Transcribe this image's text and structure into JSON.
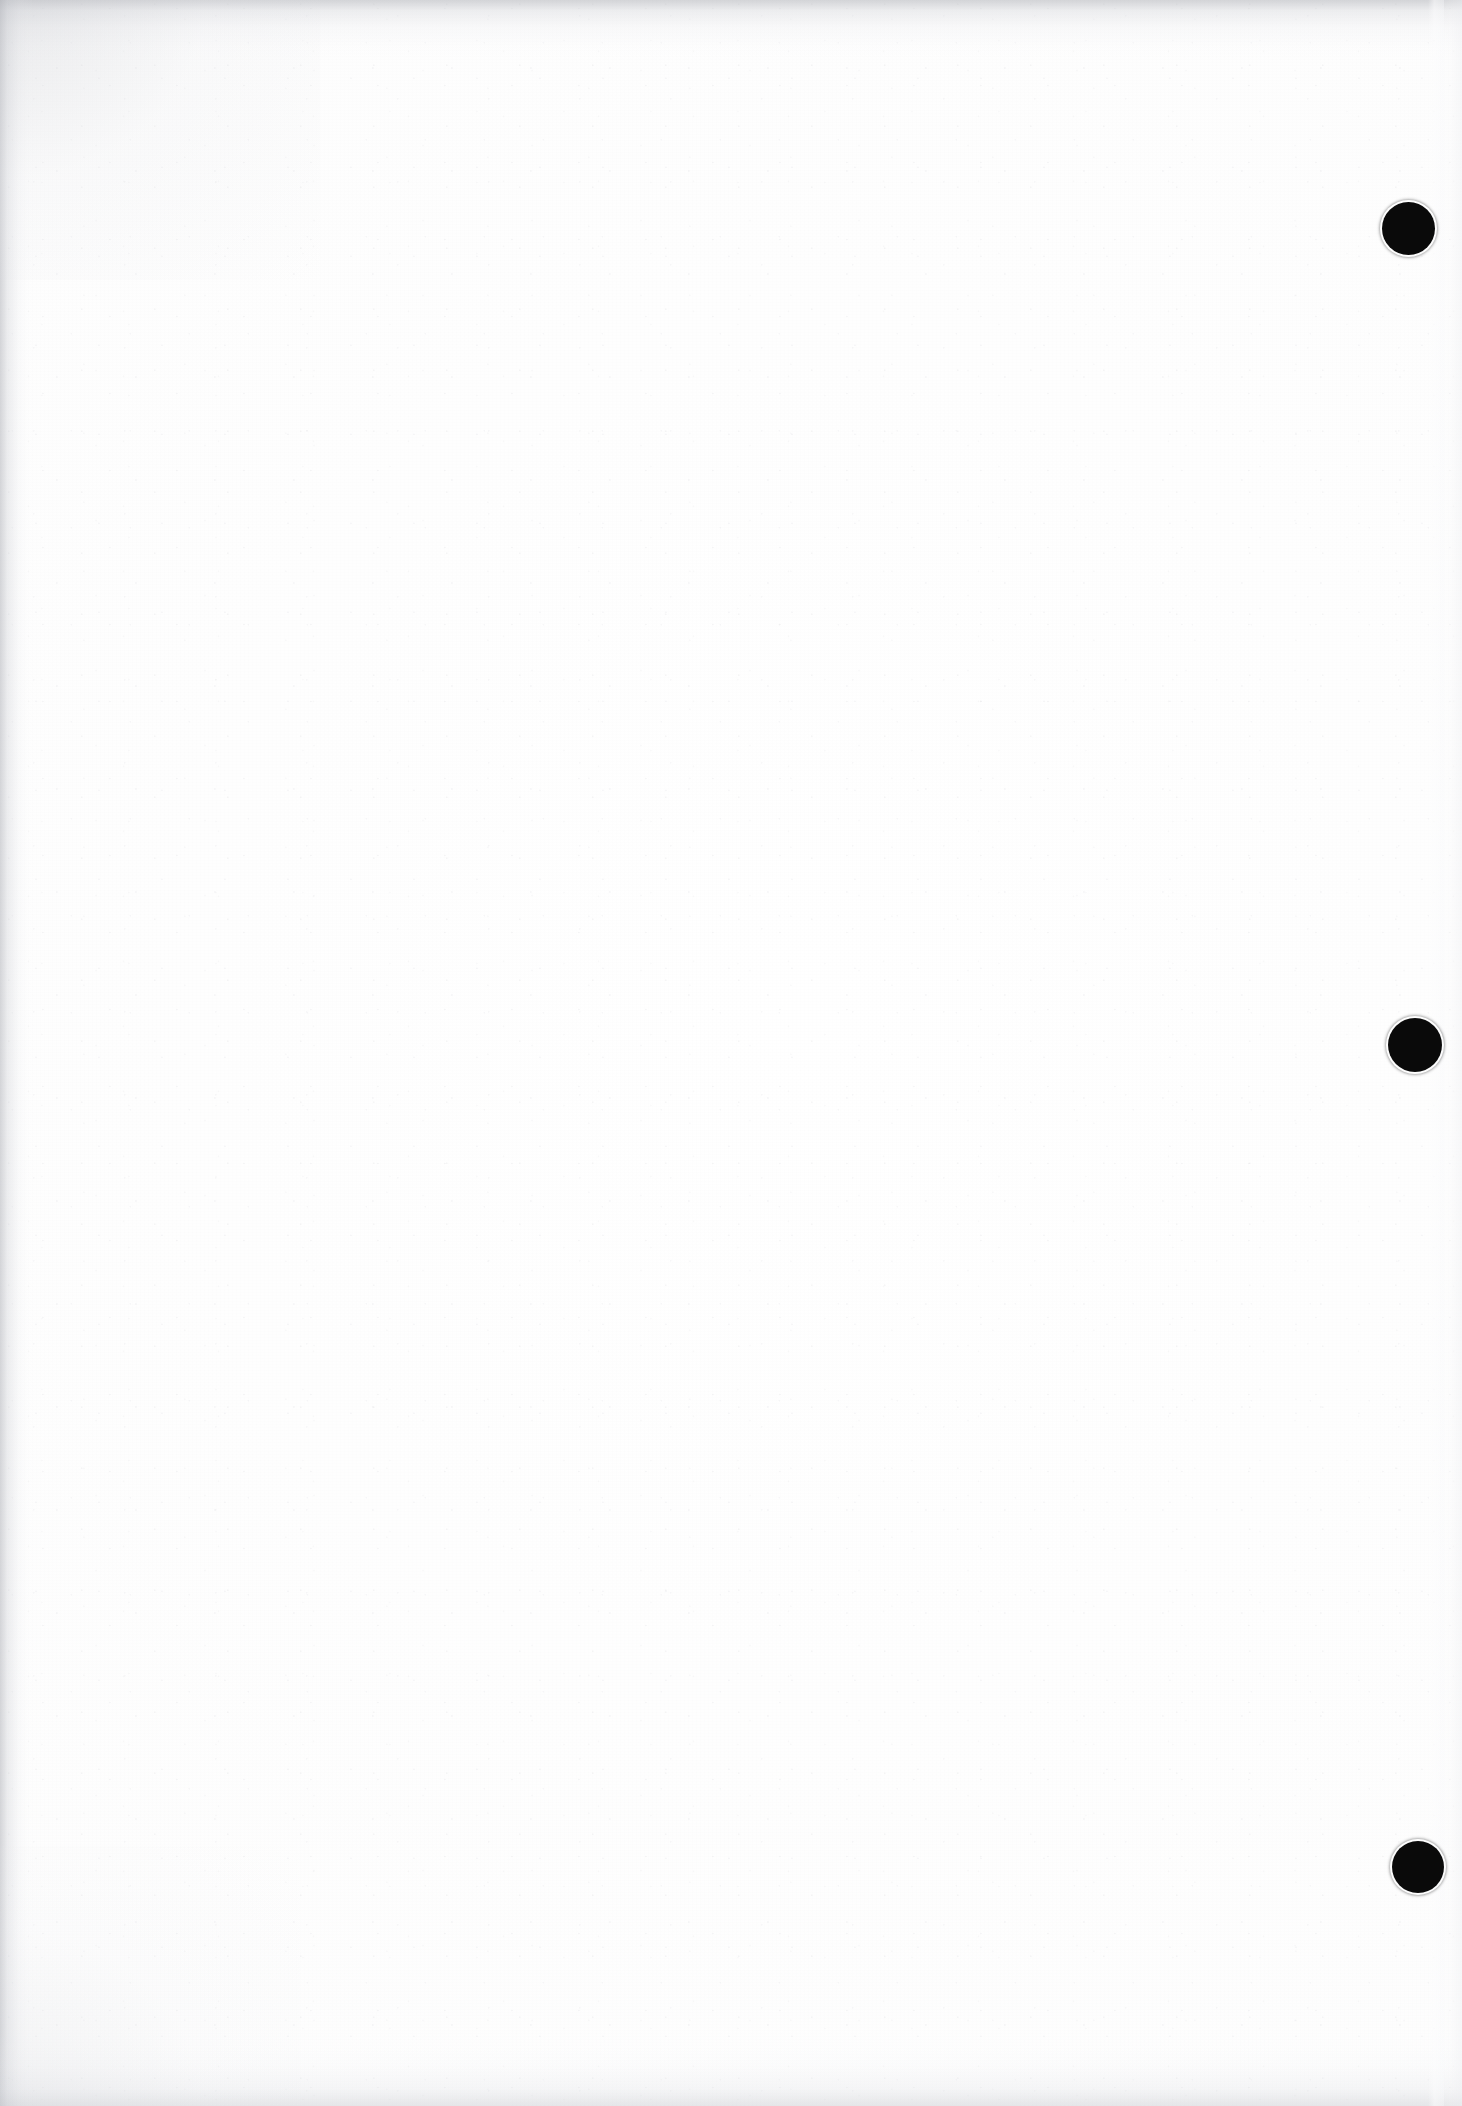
{
  "document": {
    "kind": "scanned-page",
    "title": "Blank scanned page",
    "page_width": 1462,
    "page_height": 2106,
    "background_color": "#fdfdfd",
    "body_text": "",
    "has_visible_text": false,
    "note": "Blank verso of a scanned printed page; only edge shading, paper grain and three printed registration dots are visible."
  },
  "marks": {
    "ink_color": "#0a0a0a",
    "label": "registration-dots",
    "count": 3,
    "dots": [
      {
        "id": "dot-1",
        "center_x": 1408,
        "center_y": 228,
        "diameter": 53
      },
      {
        "id": "dot-2",
        "center_x": 1415,
        "center_y": 1045,
        "diameter": 54
      },
      {
        "id": "dot-3",
        "center_x": 1418,
        "center_y": 1867,
        "diameter": 52
      }
    ]
  },
  "edges": {
    "top_shadow_color": "#b0b2b8",
    "left_shadow_color": "#aaacb3",
    "bottom_shadow_color": "#c4c6cc",
    "right_band_color": "#f8f9fb"
  }
}
